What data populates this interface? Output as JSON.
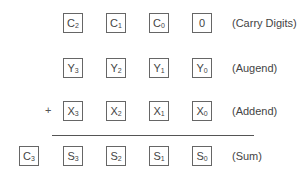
{
  "rows": [
    {
      "name": "carry",
      "label": "(Carry Digits)",
      "cells": [
        {
          "base": "C",
          "sub": "2"
        },
        {
          "base": "C",
          "sub": "1"
        },
        {
          "base": "C",
          "sub": "0"
        },
        {
          "base": "0",
          "sub": ""
        }
      ]
    },
    {
      "name": "augend",
      "label": "(Augend)",
      "cells": [
        {
          "base": "Y",
          "sub": "3"
        },
        {
          "base": "Y",
          "sub": "2"
        },
        {
          "base": "Y",
          "sub": "1"
        },
        {
          "base": "Y",
          "sub": "0"
        }
      ]
    },
    {
      "name": "addend",
      "label": "(Addend)",
      "operator": "+",
      "cells": [
        {
          "base": "X",
          "sub": "3"
        },
        {
          "base": "X",
          "sub": "2"
        },
        {
          "base": "X",
          "sub": "1"
        },
        {
          "base": "X",
          "sub": "0"
        }
      ]
    },
    {
      "name": "sum",
      "label": "(Sum)",
      "carry_out": {
        "base": "C",
        "sub": "3"
      },
      "cells": [
        {
          "base": "S",
          "sub": "3"
        },
        {
          "base": "S",
          "sub": "2"
        },
        {
          "base": "S",
          "sub": "1"
        },
        {
          "base": "S",
          "sub": "0"
        }
      ]
    }
  ]
}
